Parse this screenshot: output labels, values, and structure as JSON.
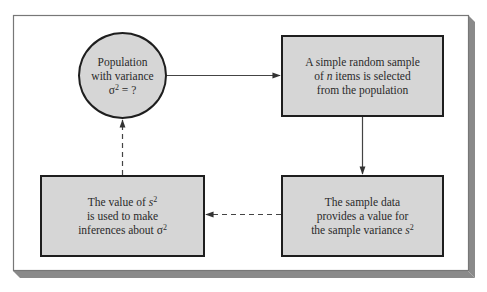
{
  "diagram": {
    "frame": {
      "background": "#ffffff",
      "border": "#777777",
      "shadow": "#8a8a8a"
    },
    "node_fill": "#d6d6d6",
    "node_border": "#1e1e1e",
    "nodes": {
      "population": {
        "shape": "circle",
        "line1": "Population",
        "line2": "with variance",
        "line3_symbol": "σ",
        "line3_sup": "2",
        "line3_rest": " = ?"
      },
      "sample": {
        "shape": "rectangle",
        "line1": "A simple random sample",
        "line2_pre": "of ",
        "line2_var": "n",
        "line2_post": " items is selected",
        "line3": "from the population"
      },
      "sample_data": {
        "shape": "rectangle",
        "line1": "The sample data",
        "line2": "provides a value for",
        "line3_pre": "the sample variance ",
        "line3_var": "s",
        "line3_sup": "2"
      },
      "inference": {
        "shape": "rectangle",
        "line1_pre": "The value of ",
        "line1_var": "s",
        "line1_sup": "2",
        "line2": "is used to make",
        "line3_pre": "inferences about ",
        "line3_symbol": "σ",
        "line3_sup": "2"
      }
    },
    "edges": [
      {
        "from": "population",
        "to": "sample",
        "style": "solid"
      },
      {
        "from": "sample",
        "to": "sample_data",
        "style": "solid"
      },
      {
        "from": "sample_data",
        "to": "inference",
        "style": "dashed"
      },
      {
        "from": "inference",
        "to": "population",
        "style": "dashed"
      }
    ]
  }
}
